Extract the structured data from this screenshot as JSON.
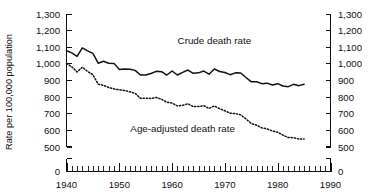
{
  "chart_data": {
    "type": "line",
    "title": "",
    "xlabel": "",
    "ylabel": "Rate per 100,000 population",
    "xlim": [
      1940,
      1990
    ],
    "ylim": [
      500,
      1300
    ],
    "y_axis_break": true,
    "y_break_label": "0",
    "grid": false,
    "legend_position": "inline-annotation",
    "xticks": [
      1940,
      1950,
      1960,
      1970,
      1980,
      1990
    ],
    "xtick_labels": [
      "1940",
      "1950",
      "1960",
      "1970",
      "1980",
      "1990"
    ],
    "x_minor_tick_interval": 1,
    "yticks": [
      500,
      600,
      700,
      800,
      900,
      1000,
      1100,
      1200,
      1300
    ],
    "ytick_labels": [
      "500",
      "600",
      "700",
      "800",
      "900",
      "1,000",
      "1,100",
      "1,200",
      "1,300"
    ],
    "ytick_labels_right": [
      "500",
      "600",
      "700",
      "800",
      "900",
      "1,000",
      "1,100",
      "1,200",
      "1,300"
    ],
    "right_axis": true,
    "annotations": [
      {
        "text": "Crude death rate",
        "x": 1968,
        "y": 1115
      },
      {
        "text": "Age-adjusted death rate",
        "x": 1962,
        "y": 588
      }
    ],
    "x": [
      1940,
      1941,
      1942,
      1943,
      1944,
      1945,
      1946,
      1947,
      1948,
      1949,
      1950,
      1951,
      1952,
      1953,
      1954,
      1955,
      1956,
      1957,
      1958,
      1959,
      1960,
      1961,
      1962,
      1963,
      1964,
      1965,
      1966,
      1967,
      1968,
      1969,
      1970,
      1971,
      1972,
      1973,
      1974,
      1975,
      1976,
      1977,
      1978,
      1979,
      1980,
      1981,
      1982,
      1983,
      1984,
      1985
    ],
    "series": [
      {
        "name": "Crude death rate",
        "style": "solid",
        "values": [
          1076,
          1063,
          1042,
          1093,
          1075,
          1060,
          1001,
          1013,
          1001,
          1000,
          963,
          966,
          965,
          958,
          930,
          930,
          939,
          952,
          950,
          930,
          954,
          930,
          946,
          960,
          940,
          943,
          954,
          935,
          966,
          951,
          945,
          932,
          943,
          942,
          915,
          889,
          889,
          878,
          881,
          870,
          878,
          864,
          860,
          874,
          866,
          875
        ]
      },
      {
        "name": "Age-adjusted death rate",
        "style": "dotted",
        "values": [
          1000,
          979,
          948,
          977,
          951,
          932,
          875,
          868,
          855,
          846,
          841,
          837,
          829,
          820,
          790,
          791,
          789,
          795,
          784,
          766,
          761,
          744,
          748,
          757,
          740,
          740,
          746,
          729,
          744,
          727,
          715,
          700,
          698,
          690,
          666,
          638,
          628,
          612,
          606,
          593,
          586,
          568,
          554,
          553,
          545,
          545
        ]
      }
    ]
  },
  "meta": {
    "ylabel_text": "Rate per 100,000 population"
  }
}
